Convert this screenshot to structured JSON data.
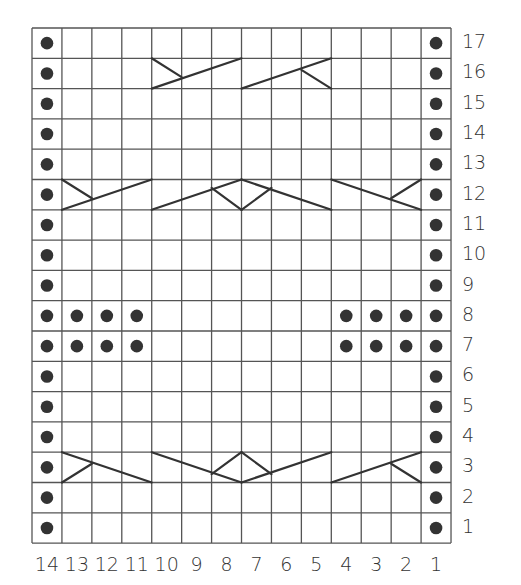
{
  "chart": {
    "columns": 14,
    "rows": 17,
    "column_labels": [
      "14",
      "13",
      "12",
      "11",
      "10",
      "9",
      "8",
      "7",
      "6",
      "5",
      "4",
      "3",
      "2",
      "1"
    ],
    "row_labels": [
      "17",
      "16",
      "15",
      "14",
      "13",
      "12",
      "11",
      "10",
      "9",
      "8",
      "7",
      "6",
      "5",
      "4",
      "3",
      "2",
      "1"
    ],
    "colors": {
      "grid": "#555555",
      "symbol": "#333333",
      "background": "#ffffff"
    },
    "legend_symbols": {
      "dot": "purl stitch",
      "empty": "knit stitch",
      "diagonal-cable": "cable cross"
    },
    "purl_dots": [
      {
        "row": 1,
        "cols": [
          14,
          1
        ]
      },
      {
        "row": 2,
        "cols": [
          14,
          1
        ]
      },
      {
        "row": 3,
        "cols": [
          14,
          1
        ]
      },
      {
        "row": 4,
        "cols": [
          14,
          1
        ]
      },
      {
        "row": 5,
        "cols": [
          14,
          1
        ]
      },
      {
        "row": 6,
        "cols": [
          14,
          1
        ]
      },
      {
        "row": 7,
        "cols": [
          14,
          13,
          12,
          11,
          4,
          3,
          2,
          1
        ]
      },
      {
        "row": 8,
        "cols": [
          14,
          13,
          12,
          11,
          4,
          3,
          2,
          1
        ]
      },
      {
        "row": 9,
        "cols": [
          14,
          1
        ]
      },
      {
        "row": 10,
        "cols": [
          14,
          1
        ]
      },
      {
        "row": 11,
        "cols": [
          14,
          1
        ]
      },
      {
        "row": 12,
        "cols": [
          14,
          1
        ]
      },
      {
        "row": 13,
        "cols": [
          14,
          1
        ]
      },
      {
        "row": 14,
        "cols": [
          14,
          1
        ]
      },
      {
        "row": 15,
        "cols": [
          14,
          1
        ]
      },
      {
        "row": 16,
        "cols": [
          14,
          1
        ]
      },
      {
        "row": 17,
        "cols": [
          14,
          1
        ]
      }
    ],
    "cables": [
      {
        "row": 3,
        "cols": "13-11",
        "type": "left-up short, long down-right"
      },
      {
        "row": 3,
        "cols": "10-8",
        "type": "long down-right with diamond"
      },
      {
        "row": 3,
        "cols": "7-5",
        "type": "long up-right with diamond"
      },
      {
        "row": 3,
        "cols": "4-2",
        "type": "long up-right, short down-right"
      },
      {
        "row": 12,
        "cols": "13-11",
        "type": "short down-right, long up-right"
      },
      {
        "row": 12,
        "cols": "10-8",
        "type": "long up-right with diamond"
      },
      {
        "row": 12,
        "cols": "7-5",
        "type": "long down-right with diamond"
      },
      {
        "row": 12,
        "cols": "4-2",
        "type": "long down-right, short up-right"
      },
      {
        "row": 16,
        "cols": "10-8",
        "type": "short down-right, long up-right"
      },
      {
        "row": 16,
        "cols": "7-5",
        "type": "long up-right, short down-right"
      }
    ]
  }
}
